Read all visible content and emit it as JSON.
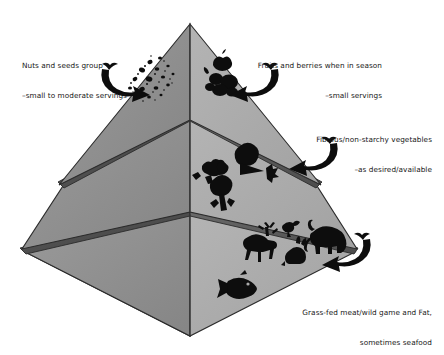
{
  "diagram": {
    "type": "three-tier-pyramid-diagram",
    "background_color": "#ffffff"
  },
  "colors": {
    "left_face": "#8e8e8e",
    "right_face": "#ababab",
    "left_face_top": "#999999",
    "right_face_top": "#b2b2b2",
    "divider_band_dark": "#4a4a4a",
    "divider_band_light": "#5c5c5c",
    "outline": "#2b2b2b",
    "icon_black": "#0d0d0d",
    "text": "#181818"
  },
  "labels": {
    "nuts": {
      "line1": "Nuts and seeds group",
      "line2": "–small to moderate servings",
      "tier": "top",
      "side": "left"
    },
    "fruits": {
      "line1": "Fruits and berries when in season",
      "line2": "–small servings",
      "tier": "top",
      "side": "right"
    },
    "vegetables": {
      "line1": "Fibrous/non-starchy vegetables",
      "line2": "–as desired/available",
      "tier": "middle",
      "side": "right"
    },
    "meat": {
      "line1": "Grass-fed meat/wild game and Fat,",
      "line2": "sometimes seafood",
      "tier": "bottom",
      "side": "right"
    }
  },
  "tiers": [
    {
      "name": "top-tier",
      "contents": [
        "nuts-and-seeds",
        "fruits-and-berries"
      ],
      "icons_left": [
        "seeds-scatter-icon",
        "nuts-cluster-icon"
      ],
      "icons_right": [
        "apple-icon",
        "berries-icon",
        "grapes-icon"
      ]
    },
    {
      "name": "middle-tier",
      "contents": [
        "fibrous-non-starchy-vegetables"
      ],
      "icons_right": [
        "broccoli-icon",
        "cabbage-icon",
        "tomato-icon",
        "carrot-icon",
        "leafy-green-icon"
      ]
    },
    {
      "name": "bottom-tier",
      "contents": [
        "grass-fed-meat",
        "wild-game",
        "fat",
        "seafood"
      ],
      "icons_right": [
        "deer-icon",
        "bird-icon",
        "rabbit-icon",
        "mammoth-icon",
        "fish-icon"
      ]
    }
  ],
  "arrows": [
    {
      "name": "arrow-to-nuts",
      "direction": "down-right",
      "target": "top-tier-left"
    },
    {
      "name": "arrow-to-fruits",
      "direction": "down-left",
      "target": "top-tier-right"
    },
    {
      "name": "arrow-to-vegetables",
      "direction": "down-left",
      "target": "middle-tier-right"
    },
    {
      "name": "arrow-to-meat",
      "direction": "down-left",
      "target": "bottom-tier-right"
    }
  ]
}
